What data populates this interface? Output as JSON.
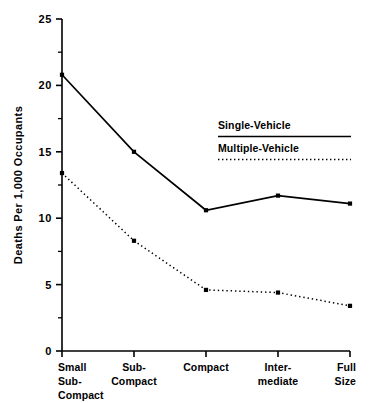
{
  "chart_data": {
    "type": "line",
    "title": "",
    "xlabel": "",
    "ylabel": "Deaths Per 1,000 Occupants",
    "categories": [
      "Small\nSub-\nCompact",
      "Sub-\nCompact",
      "Compact",
      "Inter-\nmediate",
      "Full\nSize"
    ],
    "category_lines": [
      [
        "Small",
        "Sub-",
        "Compact"
      ],
      [
        "Sub-",
        "Compact"
      ],
      [
        "Compact"
      ],
      [
        "Inter-",
        "mediate"
      ],
      [
        "Full",
        "Size"
      ]
    ],
    "ylim": [
      0,
      25
    ],
    "ytick_labels": [
      "0",
      "5",
      "10",
      "15",
      "20",
      "25"
    ],
    "ytick_values": [
      0,
      5,
      10,
      15,
      20,
      25
    ],
    "yminor_values": [
      2.5,
      7.5,
      12.5,
      17.5,
      22.5
    ],
    "grid": false,
    "legend_position": "inside-upper-right",
    "series": [
      {
        "name": "Single-Vehicle",
        "style": "solid",
        "marker": "square",
        "color": "#000000",
        "values": [
          20.8,
          15.0,
          10.6,
          11.7,
          11.1
        ]
      },
      {
        "name": "Multiple-Vehicle",
        "style": "dotted",
        "marker": "square",
        "color": "#000000",
        "values": [
          13.4,
          8.3,
          4.6,
          4.4,
          3.4
        ]
      }
    ]
  },
  "legend": {
    "entries": [
      {
        "label": "Single-Vehicle",
        "style": "solid"
      },
      {
        "label": "Multiple-Vehicle",
        "style": "dotted"
      }
    ]
  },
  "colors": {
    "ink": "#000000",
    "background": "#ffffff"
  }
}
